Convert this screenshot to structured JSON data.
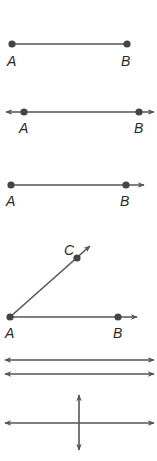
{
  "colors": {
    "line": "#555555",
    "point": "#444444",
    "label": "#2a2a2a",
    "background": "#ffffff"
  },
  "figures": [
    {
      "type": "segment",
      "name": "line segment AB",
      "labels": {
        "a": "A",
        "b": "B"
      }
    },
    {
      "type": "line",
      "name": "line AB",
      "labels": {
        "a": "A",
        "b": "B"
      }
    },
    {
      "type": "ray",
      "name": "ray AB",
      "labels": {
        "a": "A",
        "b": "B"
      }
    },
    {
      "type": "angle",
      "name": "angle CAB",
      "labels": {
        "a": "A",
        "b": "B",
        "c": "C"
      }
    },
    {
      "type": "parallel-lines",
      "name": "parallel lines"
    },
    {
      "type": "perpendicular-lines",
      "name": "perpendicular lines"
    }
  ]
}
